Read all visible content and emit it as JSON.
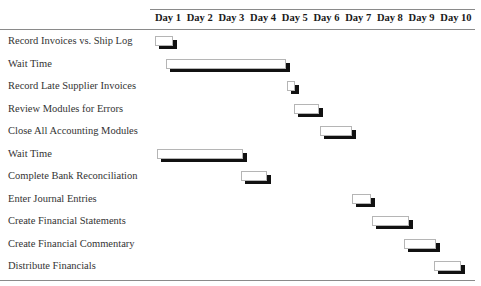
{
  "chart_data": {
    "type": "gantt",
    "title": "",
    "xlabel": "",
    "ylabel": "",
    "columns": [
      "Day 1",
      "Day 2",
      "Day 3",
      "Day 4",
      "Day 5",
      "Day 6",
      "Day 7",
      "Day 8",
      "Day 9",
      "Day 10"
    ],
    "tasks": [
      {
        "name": "Record Invoices vs. Ship Log",
        "start": 1.0,
        "end": 1.6
      },
      {
        "name": "Wait Time",
        "start": 1.35,
        "end": 5.15
      },
      {
        "name": "Record Late Supplier Invoices",
        "start": 5.15,
        "end": 5.45
      },
      {
        "name": "Review Modules for Errors",
        "start": 5.4,
        "end": 6.2
      },
      {
        "name": "Close All Accounting Modules",
        "start": 6.2,
        "end": 7.25
      },
      {
        "name": "Wait Time",
        "start": 1.05,
        "end": 3.8
      },
      {
        "name": "Complete Bank Reconciliation",
        "start": 3.7,
        "end": 4.55
      },
      {
        "name": "Enter Journal Entries",
        "start": 7.2,
        "end": 7.85
      },
      {
        "name": "Create Financial Statements",
        "start": 7.85,
        "end": 9.05
      },
      {
        "name": "Create Financial Commentary",
        "start": 8.85,
        "end": 9.9
      },
      {
        "name": "Distribute Financials",
        "start": 9.8,
        "end": 10.7
      }
    ],
    "grid": false,
    "legend": null
  },
  "layout": {
    "chart_left": 155,
    "day_width": 31.7,
    "row_top": 36,
    "row_height": 22.5
  }
}
